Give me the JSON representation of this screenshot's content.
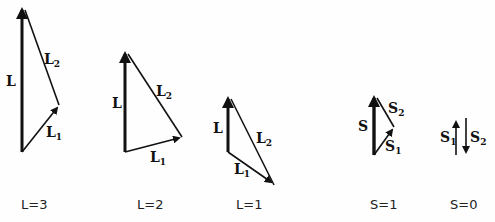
{
  "diagrams": [
    {
      "id": "L3",
      "caption": "L=3",
      "resultant": {
        "symbol": "L",
        "sub": ""
      },
      "v1": {
        "symbol": "L",
        "sub": "1"
      },
      "v2": {
        "symbol": "L",
        "sub": "2"
      }
    },
    {
      "id": "L2",
      "caption": "L=2",
      "resultant": {
        "symbol": "L",
        "sub": ""
      },
      "v1": {
        "symbol": "L",
        "sub": "1"
      },
      "v2": {
        "symbol": "L",
        "sub": "2"
      }
    },
    {
      "id": "L1",
      "caption": "L=1",
      "resultant": {
        "symbol": "L",
        "sub": ""
      },
      "v1": {
        "symbol": "L",
        "sub": "1"
      },
      "v2": {
        "symbol": "L",
        "sub": "2"
      }
    },
    {
      "id": "S1",
      "caption": "S=1",
      "resultant": {
        "symbol": "S",
        "sub": ""
      },
      "v1": {
        "symbol": "S",
        "sub": "1"
      },
      "v2": {
        "symbol": "S",
        "sub": "2"
      }
    },
    {
      "id": "S0",
      "caption": "S=0",
      "v1": {
        "symbol": "S",
        "sub": "1"
      },
      "v2": {
        "symbol": "S",
        "sub": "2"
      }
    }
  ],
  "colors": {
    "ink": "#111111",
    "background": "#fefefe"
  }
}
